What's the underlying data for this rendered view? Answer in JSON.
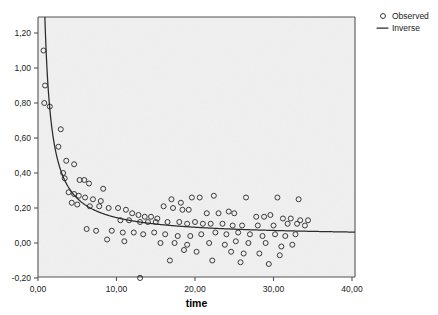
{
  "chart_data": {
    "type": "scatter",
    "title": "",
    "xlabel": "time",
    "ylabel": "",
    "xlim": [
      -1.0,
      42.5
    ],
    "ylim": [
      -0.28,
      1.33
    ],
    "grid": false,
    "legend_position": "top-right",
    "xticks": [
      0,
      10,
      20,
      30,
      40
    ],
    "xticklabels": [
      "0,00",
      "10,00",
      "20,00",
      "30,00",
      "40,00"
    ],
    "yticks": [
      -0.2,
      0.0,
      0.2,
      0.4,
      0.6,
      0.8,
      1.0,
      1.2
    ],
    "yticklabels": [
      "-0,20",
      "0,00",
      "0,20",
      "0,40",
      "0,60",
      "0,80",
      "1,00",
      "1,20"
    ],
    "series": [
      {
        "name": "Observed",
        "type": "scatter",
        "marker": "open-circle",
        "color": "#3a3a3a",
        "points": [
          [
            0.7,
            1.1
          ],
          [
            0.9,
            0.9
          ],
          [
            0.8,
            0.8
          ],
          [
            1.5,
            0.78
          ],
          [
            2.9,
            0.65
          ],
          [
            2.6,
            0.55
          ],
          [
            3.6,
            0.47
          ],
          [
            4.6,
            0.45
          ],
          [
            3.2,
            0.4
          ],
          [
            3.4,
            0.37
          ],
          [
            5.3,
            0.36
          ],
          [
            5.9,
            0.36
          ],
          [
            6.5,
            0.34
          ],
          [
            8.3,
            0.31
          ],
          [
            3.9,
            0.29
          ],
          [
            4.6,
            0.28
          ],
          [
            5.2,
            0.27
          ],
          [
            6.0,
            0.26
          ],
          [
            7.0,
            0.25
          ],
          [
            8.0,
            0.24
          ],
          [
            4.3,
            0.23
          ],
          [
            5.0,
            0.22
          ],
          [
            6.6,
            0.21
          ],
          [
            7.8,
            0.21
          ],
          [
            9.0,
            0.2
          ],
          [
            10.2,
            0.2
          ],
          [
            11.2,
            0.19
          ],
          [
            17.0,
            0.25
          ],
          [
            18.2,
            0.23
          ],
          [
            19.6,
            0.26
          ],
          [
            20.6,
            0.26
          ],
          [
            22.4,
            0.27
          ],
          [
            26.5,
            0.26
          ],
          [
            30.5,
            0.26
          ],
          [
            33.2,
            0.25
          ],
          [
            16.0,
            0.21
          ],
          [
            17.2,
            0.2
          ],
          [
            18.4,
            0.19
          ],
          [
            19.2,
            0.19
          ],
          [
            21.5,
            0.17
          ],
          [
            23.0,
            0.17
          ],
          [
            24.3,
            0.18
          ],
          [
            25.0,
            0.17
          ],
          [
            27.8,
            0.15
          ],
          [
            28.8,
            0.15
          ],
          [
            29.6,
            0.16
          ],
          [
            31.2,
            0.14
          ],
          [
            32.2,
            0.14
          ],
          [
            33.4,
            0.13
          ],
          [
            34.4,
            0.13
          ],
          [
            12.0,
            0.17
          ],
          [
            12.8,
            0.16
          ],
          [
            13.6,
            0.15
          ],
          [
            14.4,
            0.15
          ],
          [
            15.2,
            0.14
          ],
          [
            10.5,
            0.13
          ],
          [
            11.6,
            0.13
          ],
          [
            13.0,
            0.12
          ],
          [
            14.0,
            0.12
          ],
          [
            15.0,
            0.12
          ],
          [
            16.5,
            0.12
          ],
          [
            18.0,
            0.12
          ],
          [
            19.0,
            0.11
          ],
          [
            20.0,
            0.12
          ],
          [
            21.0,
            0.11
          ],
          [
            22.0,
            0.11
          ],
          [
            23.5,
            0.11
          ],
          [
            24.8,
            0.1
          ],
          [
            26.0,
            0.1
          ],
          [
            28.0,
            0.1
          ],
          [
            30.0,
            0.1
          ],
          [
            31.8,
            0.11
          ],
          [
            33.0,
            0.11
          ],
          [
            34.0,
            0.1
          ],
          [
            6.2,
            0.08
          ],
          [
            7.4,
            0.07
          ],
          [
            9.4,
            0.07
          ],
          [
            10.8,
            0.06
          ],
          [
            12.2,
            0.06
          ],
          [
            13.4,
            0.05
          ],
          [
            14.8,
            0.06
          ],
          [
            16.2,
            0.05
          ],
          [
            17.8,
            0.04
          ],
          [
            19.4,
            0.04
          ],
          [
            20.8,
            0.05
          ],
          [
            22.6,
            0.06
          ],
          [
            24.0,
            0.05
          ],
          [
            25.5,
            0.06
          ],
          [
            27.0,
            0.05
          ],
          [
            28.6,
            0.04
          ],
          [
            30.2,
            0.05
          ],
          [
            31.5,
            0.04
          ],
          [
            32.8,
            0.05
          ],
          [
            8.8,
            0.02
          ],
          [
            11.0,
            0.01
          ],
          [
            15.6,
            0.0
          ],
          [
            17.4,
            0.0
          ],
          [
            19.0,
            -0.01
          ],
          [
            21.8,
            0.0
          ],
          [
            23.8,
            -0.01
          ],
          [
            25.2,
            0.01
          ],
          [
            26.8,
            0.0
          ],
          [
            29.0,
            0.0
          ],
          [
            31.0,
            -0.02
          ],
          [
            32.4,
            -0.01
          ],
          [
            18.6,
            -0.04
          ],
          [
            20.2,
            -0.05
          ],
          [
            24.6,
            -0.05
          ],
          [
            26.2,
            -0.06
          ],
          [
            28.2,
            -0.06
          ],
          [
            30.8,
            -0.07
          ],
          [
            13.0,
            -0.2
          ],
          [
            16.8,
            -0.1
          ],
          [
            22.2,
            -0.1
          ],
          [
            25.8,
            -0.11
          ],
          [
            29.4,
            -0.12
          ]
        ]
      },
      {
        "name": "Inverse",
        "type": "line",
        "color": "#2b2b2b",
        "model": "y = b0 + b1/x",
        "b0": 0.035,
        "b1": 1.1,
        "x_start": 0.8,
        "x_end": 41.5
      }
    ]
  },
  "legend": {
    "items": [
      {
        "label": "Observed",
        "marker": "open-circle"
      },
      {
        "label": "Inverse",
        "marker": "line"
      }
    ]
  },
  "axes": {
    "x_title": "time"
  },
  "colors": {
    "plot_background": "#f0f0f0",
    "axis": "#555555",
    "marker": "#3a3a3a",
    "curve": "#2b2b2b"
  }
}
